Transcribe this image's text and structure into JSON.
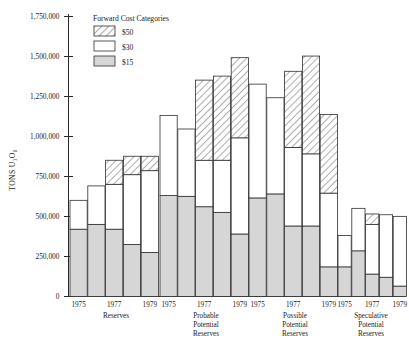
{
  "chart": {
    "type": "bar",
    "title": "",
    "ylabel": "TONS U₃O₈",
    "xlabel": ""
  },
  "legend": {
    "title": "Forward Cost Categories",
    "items": [
      {
        "label": "$50",
        "pattern": "hatched",
        "color": "#ffffff"
      },
      {
        "label": "$30",
        "pattern": "solid",
        "color": "#ffffff"
      },
      {
        "label": "$15",
        "pattern": "solid",
        "color": "#d6d6d6"
      }
    ]
  },
  "yaxis": {
    "ticks": [
      "1,750,000",
      "1,500,000",
      "1,250,000",
      "1,000,000",
      "750,000",
      "500,000",
      "250,000",
      "0"
    ],
    "tick_values": [
      1750000,
      1500000,
      1250000,
      1000000,
      750000,
      500000,
      250000,
      0
    ],
    "min": 0,
    "max": 1750000
  },
  "xaxis": {
    "years": [
      "1975",
      "1976",
      "1977",
      "1978",
      "1979"
    ],
    "year_labels_shown": [
      "1975",
      "1977",
      "1979"
    ],
    "groups": [
      {
        "id": "reserves",
        "label_lines": [
          "Reserves"
        ]
      },
      {
        "id": "probable",
        "label_lines": [
          "Probable",
          "Potential",
          "Reserves"
        ]
      },
      {
        "id": "possible",
        "label_lines": [
          "Possible",
          "Potential",
          "Reserves"
        ]
      },
      {
        "id": "speculative",
        "label_lines": [
          "Speculative",
          "Potential",
          "Reserves"
        ]
      }
    ]
  },
  "chart_data": {
    "type": "bar",
    "subtype": "stacked",
    "title": "",
    "ylabel": "TONS U3O8",
    "xlabel": "",
    "ylim": [
      0,
      1750000
    ],
    "yticks": [
      0,
      250000,
      500000,
      750000,
      1000000,
      1250000,
      1500000,
      1750000
    ],
    "grid": false,
    "legend_position": "top-left-inside",
    "legend_title": "Forward Cost Categories",
    "series": [
      {
        "name": "$15",
        "pattern": "solid-gray",
        "color": "#d6d6d6"
      },
      {
        "name": "$30",
        "pattern": "solid-white",
        "color": "#ffffff"
      },
      {
        "name": "$50",
        "pattern": "hatched",
        "color": "#ffffff"
      }
    ],
    "groups": [
      {
        "name": "Reserves",
        "categories": [
          "1975",
          "1976",
          "1977",
          "1978",
          "1979"
        ],
        "values": {
          "$15": [
            420000,
            450000,
            420000,
            325000,
            275000
          ],
          "$30": [
            180000,
            240000,
            280000,
            435000,
            510000
          ],
          "$50": [
            0,
            0,
            150000,
            115000,
            90000
          ]
        },
        "totals": [
          600000,
          690000,
          850000,
          875000,
          875000
        ]
      },
      {
        "name": "Probable Potential Reserves",
        "categories": [
          "1975",
          "1976",
          "1977",
          "1978",
          "1979"
        ],
        "values": {
          "$15": [
            630000,
            625000,
            560000,
            525000,
            390000
          ],
          "$30": [
            500000,
            420000,
            290000,
            325000,
            600000
          ],
          "$50": [
            0,
            0,
            500000,
            525000,
            500000
          ]
        },
        "totals": [
          1130000,
          1045000,
          1350000,
          1375000,
          1490000
        ]
      },
      {
        "name": "Possible Potential Reserves",
        "categories": [
          "1975",
          "1976",
          "1977",
          "1978",
          "1979"
        ],
        "values": {
          "$15": [
            615000,
            640000,
            440000,
            440000,
            185000
          ],
          "$30": [
            710000,
            600000,
            490000,
            450000,
            460000
          ],
          "$50": [
            0,
            0,
            475000,
            610000,
            490000
          ]
        },
        "totals": [
          1325000,
          1240000,
          1405000,
          1500000,
          1135000
        ]
      },
      {
        "name": "Speculative Potential Reserves",
        "categories": [
          "1975",
          "1976",
          "1977",
          "1978",
          "1979"
        ],
        "values": {
          "$15": [
            185000,
            285000,
            140000,
            120000,
            65000
          ],
          "$30": [
            195000,
            265000,
            310000,
            390000,
            435000
          ],
          "$50": [
            0,
            0,
            65000,
            0,
            0
          ]
        },
        "totals": [
          380000,
          550000,
          515000,
          510000,
          500000
        ]
      }
    ]
  }
}
